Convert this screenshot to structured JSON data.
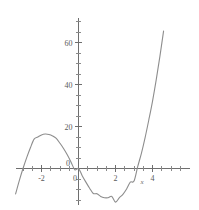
{
  "figure": {
    "background_color": "#ffffff",
    "curve_color": "#8d8d8d",
    "axis_color": "#6e6e6e",
    "label_color": "#5a5a5a"
  },
  "chart_data": {
    "type": "line",
    "title": "",
    "subtitle": "",
    "xlabel": "x",
    "ylabel": "",
    "xlim": [
      -3.4,
      5.5
    ],
    "ylim": [
      -20,
      70
    ],
    "grid": false,
    "legend": null,
    "x_ticks_major": [
      -2,
      0,
      2,
      4
    ],
    "x_tick_labels": [
      "-2",
      "0",
      "2",
      "4"
    ],
    "y_ticks_major": [
      20,
      40,
      60
    ],
    "y_tick_labels": [
      "20",
      "40",
      "60"
    ],
    "origin_label_y": "0",
    "origin_label_x": "0",
    "x_tick_step_minor": 0.5,
    "y_tick_step_minor": 5,
    "series": [
      {
        "name": "cubic",
        "equation": "y = 2x^3 - 6x^2 - 8x",
        "x": [
          -3.4,
          -3.2,
          -3.0,
          -2.8,
          -2.6,
          -2.4,
          -2.2,
          -2.0,
          -1.8,
          -1.6,
          -1.4,
          -1.2,
          -1.0,
          -0.8,
          -0.6,
          -0.4,
          -0.2,
          0.0,
          0.2,
          0.4,
          0.6,
          0.8,
          1.0,
          1.2,
          1.4,
          1.6,
          1.8,
          2.0,
          2.2,
          2.4,
          2.6,
          2.8,
          3.0,
          3.2,
          3.4,
          3.6,
          3.8,
          4.0,
          4.2,
          4.4,
          4.6,
          4.8,
          5.0,
          5.2,
          5.4
        ],
        "y": [
          -12.1,
          -5.8,
          -0.0,
          5.2,
          9.9,
          14.0,
          15.0,
          16.0,
          16.4,
          16.2,
          15.5,
          14.3,
          12.0,
          9.4,
          6.4,
          3.0,
          -0.6,
          0.0,
          -3.4,
          -6.5,
          -9.4,
          -11.9,
          -12.0,
          -13.3,
          -13.9,
          -13.9,
          -13.3,
          -16.0,
          -14.0,
          -12.3,
          -9.8,
          -6.5,
          -6.0,
          0.9,
          7.2,
          14.7,
          23.1,
          32.0,
          42.2,
          53.4,
          65.5,
          78.8,
          90.0,
          106.0,
          120.0
        ],
        "through_origin": true,
        "local_max": {
          "x": -2.0,
          "y": 16.0
        },
        "local_min": {
          "x": 2.0,
          "y": -16.0
        },
        "x_intercepts": [
          -3.0,
          0.0,
          3.4
        ]
      }
    ]
  }
}
